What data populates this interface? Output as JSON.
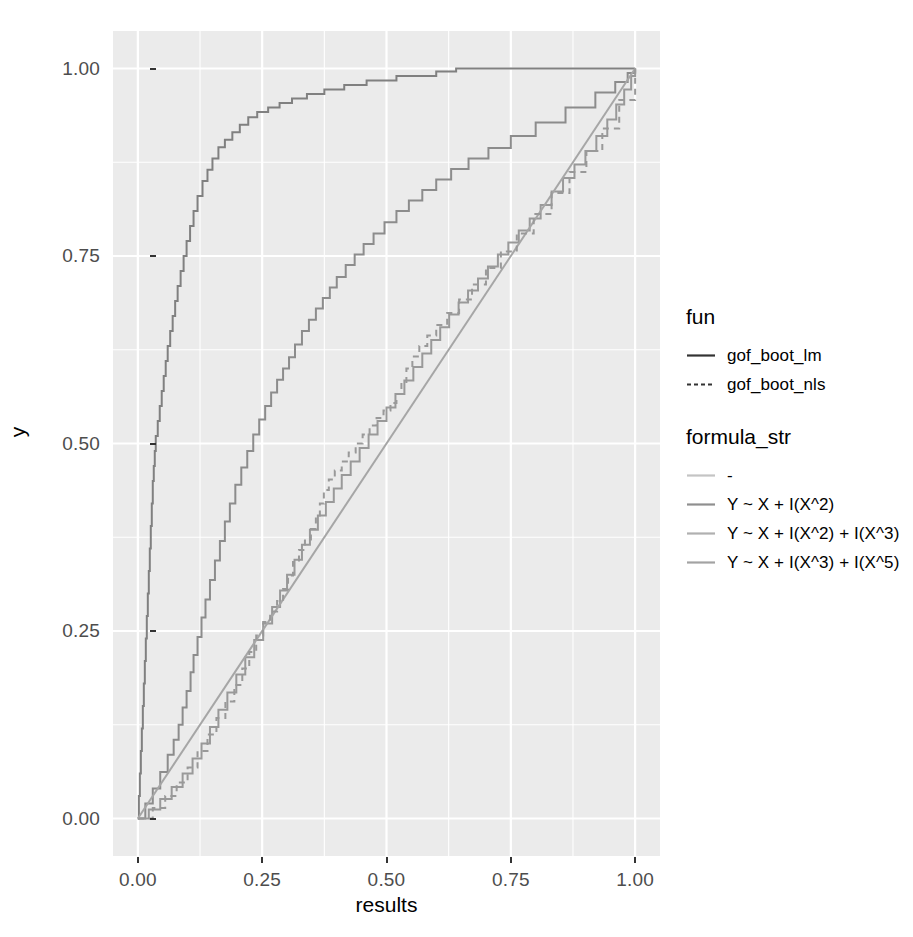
{
  "chart_data": {
    "type": "line",
    "title": "",
    "xlabel": "results",
    "ylabel": "y",
    "xlim": [
      -0.05,
      1.05
    ],
    "ylim": [
      -0.05,
      1.05
    ],
    "grid": true,
    "legend_position": "right",
    "x_ticks": [
      "0.00",
      "0.25",
      "0.50",
      "0.75",
      "1.00"
    ],
    "x_tick_values": [
      0.0,
      0.25,
      0.5,
      0.75,
      1.0
    ],
    "y_ticks": [
      "0.00",
      "0.25",
      "0.50",
      "0.75",
      "1.00"
    ],
    "y_tick_values": [
      0.0,
      0.25,
      0.5,
      0.75,
      1.0
    ],
    "panel_background": "#ebebeb",
    "grid_color": "#ffffff",
    "series": [
      {
        "name": "gof_boot_lm / Y ~ X + I(X^2)",
        "fun": "gof_boot_lm",
        "formula_str": "Y ~ X + I(X^2)",
        "linetype": "solid",
        "color": "#808080",
        "step": true,
        "x": [
          0.0,
          0.002,
          0.004,
          0.006,
          0.008,
          0.01,
          0.012,
          0.014,
          0.016,
          0.018,
          0.02,
          0.022,
          0.024,
          0.026,
          0.028,
          0.03,
          0.032,
          0.034,
          0.036,
          0.04,
          0.044,
          0.048,
          0.052,
          0.056,
          0.06,
          0.065,
          0.07,
          0.075,
          0.08,
          0.086,
          0.092,
          0.098,
          0.105,
          0.112,
          0.12,
          0.13,
          0.14,
          0.15,
          0.162,
          0.175,
          0.19,
          0.205,
          0.222,
          0.24,
          0.262,
          0.285,
          0.31,
          0.34,
          0.375,
          0.415,
          0.46,
          0.52,
          0.6,
          0.64,
          1.0
        ],
        "y": [
          0.0,
          0.03,
          0.06,
          0.09,
          0.12,
          0.15,
          0.18,
          0.21,
          0.24,
          0.27,
          0.3,
          0.33,
          0.36,
          0.39,
          0.42,
          0.45,
          0.47,
          0.49,
          0.51,
          0.53,
          0.55,
          0.57,
          0.59,
          0.61,
          0.63,
          0.65,
          0.67,
          0.69,
          0.71,
          0.73,
          0.75,
          0.77,
          0.79,
          0.81,
          0.83,
          0.85,
          0.865,
          0.88,
          0.895,
          0.905,
          0.915,
          0.925,
          0.935,
          0.942,
          0.948,
          0.954,
          0.96,
          0.966,
          0.972,
          0.978,
          0.984,
          0.99,
          0.996,
          1.0,
          1.0
        ]
      },
      {
        "name": "gof_boot_lm / Y ~ X + I(X^2) + I(X^3)",
        "fun": "gof_boot_lm",
        "formula_str": "Y ~ X + I(X^2) + I(X^3)",
        "linetype": "solid",
        "color": "#8c8c8c",
        "step": true,
        "x": [
          0.0,
          0.015,
          0.03,
          0.045,
          0.06,
          0.072,
          0.082,
          0.09,
          0.098,
          0.106,
          0.112,
          0.12,
          0.128,
          0.136,
          0.145,
          0.155,
          0.165,
          0.175,
          0.185,
          0.196,
          0.208,
          0.22,
          0.232,
          0.244,
          0.256,
          0.268,
          0.28,
          0.292,
          0.304,
          0.316,
          0.33,
          0.344,
          0.358,
          0.372,
          0.386,
          0.4,
          0.418,
          0.436,
          0.454,
          0.474,
          0.496,
          0.52,
          0.545,
          0.572,
          0.6,
          0.63,
          0.665,
          0.705,
          0.75,
          0.8,
          0.86,
          0.92,
          0.96,
          0.985,
          1.0
        ],
        "y": [
          0.0,
          0.02,
          0.04,
          0.062,
          0.085,
          0.105,
          0.125,
          0.148,
          0.17,
          0.195,
          0.218,
          0.242,
          0.268,
          0.292,
          0.318,
          0.344,
          0.37,
          0.396,
          0.42,
          0.445,
          0.468,
          0.49,
          0.512,
          0.532,
          0.55,
          0.568,
          0.585,
          0.6,
          0.615,
          0.632,
          0.65,
          0.665,
          0.68,
          0.694,
          0.708,
          0.722,
          0.738,
          0.752,
          0.766,
          0.78,
          0.795,
          0.81,
          0.824,
          0.838,
          0.852,
          0.866,
          0.88,
          0.894,
          0.91,
          0.928,
          0.948,
          0.968,
          0.982,
          0.994,
          1.0
        ]
      },
      {
        "name": "gof_boot_lm / Y ~ X + I(X^3) + I(X^5)",
        "fun": "gof_boot_lm",
        "formula_str": "Y ~ X + I(X^3) + I(X^5)",
        "linetype": "solid",
        "color": "#999999",
        "step": true,
        "x": [
          0.0,
          0.022,
          0.045,
          0.068,
          0.09,
          0.11,
          0.128,
          0.145,
          0.162,
          0.18,
          0.198,
          0.216,
          0.234,
          0.252,
          0.27,
          0.286,
          0.3,
          0.315,
          0.33,
          0.346,
          0.362,
          0.378,
          0.394,
          0.41,
          0.428,
          0.446,
          0.464,
          0.482,
          0.5,
          0.518,
          0.536,
          0.554,
          0.572,
          0.59,
          0.608,
          0.626,
          0.645,
          0.664,
          0.684,
          0.704,
          0.724,
          0.745,
          0.766,
          0.788,
          0.81,
          0.832,
          0.855,
          0.878,
          0.9,
          0.922,
          0.944,
          0.962,
          0.978,
          0.992,
          1.0
        ],
        "y": [
          0.0,
          0.012,
          0.026,
          0.042,
          0.06,
          0.08,
          0.1,
          0.122,
          0.145,
          0.168,
          0.192,
          0.215,
          0.238,
          0.26,
          0.282,
          0.304,
          0.325,
          0.345,
          0.365,
          0.385,
          0.404,
          0.422,
          0.44,
          0.458,
          0.476,
          0.494,
          0.512,
          0.53,
          0.548,
          0.566,
          0.584,
          0.602,
          0.62,
          0.638,
          0.655,
          0.672,
          0.688,
          0.704,
          0.72,
          0.736,
          0.752,
          0.768,
          0.784,
          0.8,
          0.818,
          0.836,
          0.854,
          0.872,
          0.89,
          0.91,
          0.932,
          0.952,
          0.972,
          0.99,
          1.0
        ]
      },
      {
        "name": "gof_boot_lm / -",
        "fun": "gof_boot_lm",
        "formula_str": "-",
        "linetype": "solid",
        "color": "#a6a6a6",
        "step": false,
        "x": [
          0.0,
          1.0
        ],
        "y": [
          0.0,
          1.0
        ]
      },
      {
        "name": "gof_boot_nls / Y ~ X + I(X^3) + I(X^5)",
        "fun": "gof_boot_nls",
        "formula_str": "Y ~ X + I(X^3) + I(X^5)",
        "linetype": "dashed",
        "color": "#999999",
        "step": true,
        "x": [
          0.0,
          0.03,
          0.055,
          0.078,
          0.1,
          0.12,
          0.14,
          0.158,
          0.176,
          0.194,
          0.21,
          0.224,
          0.238,
          0.252,
          0.266,
          0.28,
          0.292,
          0.302,
          0.312,
          0.324,
          0.336,
          0.348,
          0.358,
          0.366,
          0.374,
          0.384,
          0.396,
          0.41,
          0.424,
          0.438,
          0.452,
          0.466,
          0.48,
          0.494,
          0.508,
          0.52,
          0.53,
          0.54,
          0.552,
          0.566,
          0.582,
          0.6,
          0.622,
          0.646,
          0.672,
          0.7,
          0.73,
          0.762,
          0.796,
          0.832,
          0.868,
          0.902,
          0.934,
          0.968,
          1.0
        ],
        "y": [
          0.0,
          0.014,
          0.03,
          0.048,
          0.068,
          0.09,
          0.112,
          0.134,
          0.156,
          0.178,
          0.2,
          0.222,
          0.244,
          0.262,
          0.276,
          0.29,
          0.306,
          0.324,
          0.342,
          0.358,
          0.372,
          0.386,
          0.402,
          0.42,
          0.438,
          0.452,
          0.464,
          0.476,
          0.488,
          0.5,
          0.512,
          0.524,
          0.534,
          0.544,
          0.554,
          0.566,
          0.582,
          0.6,
          0.616,
          0.63,
          0.644,
          0.658,
          0.674,
          0.692,
          0.712,
          0.734,
          0.756,
          0.78,
          0.806,
          0.834,
          0.862,
          0.89,
          0.92,
          0.958,
          1.0
        ]
      }
    ]
  },
  "axes": {
    "x_title": "results",
    "y_title": "y",
    "x_tick_labels": [
      "0.00",
      "0.25",
      "0.50",
      "0.75",
      "1.00"
    ],
    "y_tick_labels": [
      "0.00",
      "0.25",
      "0.50",
      "0.75",
      "1.00"
    ]
  },
  "legends": [
    {
      "title": "fun",
      "items": [
        {
          "label": "gof_boot_lm",
          "linetype": "solid",
          "color": "#333333"
        },
        {
          "label": "gof_boot_nls",
          "linetype": "dashed",
          "color": "#333333"
        }
      ]
    },
    {
      "title": "formula_str",
      "items": [
        {
          "label": "-",
          "linetype": "solid",
          "color": "#c4c4c4"
        },
        {
          "label": "Y ~ X + I(X^2)",
          "linetype": "solid",
          "color": "#8f8f8f"
        },
        {
          "label": "Y ~ X + I(X^2) + I(X^3)",
          "linetype": "solid",
          "color": "#b0b0b0"
        },
        {
          "label": "Y ~ X + I(X^3) + I(X^5)",
          "linetype": "solid",
          "color": "#a3a3a3"
        }
      ]
    }
  ]
}
